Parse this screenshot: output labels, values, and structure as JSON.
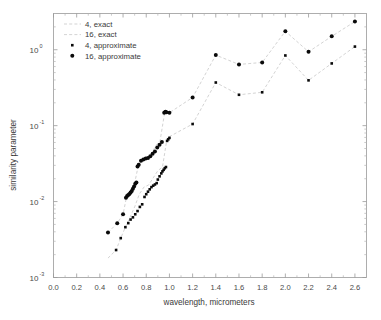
{
  "chart_data": {
    "type": "scatter",
    "title": "",
    "xlabel": "wavelength, micrometers",
    "ylabel": "similarity parameter",
    "xlim": [
      0.0,
      2.7
    ],
    "ylim": [
      0.001,
      3.0
    ],
    "yscale": "log",
    "xscale": "linear",
    "grid": false,
    "legend_position": "upper-left",
    "xticks": [
      "0.0",
      "0.2",
      "0.4",
      "0.6",
      "0.8",
      "1.0",
      "1.2",
      "1.4",
      "1.6",
      "1.8",
      "2.0",
      "2.2",
      "2.4",
      "2.6"
    ],
    "xtick_values": [
      0.0,
      0.2,
      0.4,
      0.6,
      0.8,
      1.0,
      1.2,
      1.4,
      1.6,
      1.8,
      2.0,
      2.2,
      2.4,
      2.6
    ],
    "yticks": [
      "10^0",
      "10^-1",
      "10^-2",
      "10^-3"
    ],
    "ytick_values": [
      1,
      0.1,
      0.01,
      0.001
    ],
    "ytick_base": "10",
    "ytick_exponents": [
      "0",
      "-1",
      "-2",
      "-3"
    ],
    "series": [
      {
        "name": "4, exact",
        "marker": "none",
        "line": "dashed",
        "color": "#c8c8c8",
        "x": [
          0.47,
          0.54,
          0.58,
          0.62,
          0.66,
          0.7,
          0.74,
          0.78,
          0.82,
          0.86,
          0.9,
          0.94,
          0.98,
          1.2,
          1.4,
          1.6,
          1.8,
          2.0,
          2.2,
          2.4,
          2.6
        ],
        "y": [
          0.0018,
          0.0023,
          0.0033,
          0.0046,
          0.0062,
          0.0085,
          0.0125,
          0.0155,
          0.0165,
          0.0205,
          0.0255,
          0.0285,
          0.069,
          0.105,
          0.37,
          0.255,
          0.275,
          0.84,
          0.395,
          0.66,
          1.1
        ]
      },
      {
        "name": "16, exact",
        "marker": "none",
        "line": "dashed",
        "color": "#c8c8c8",
        "x": [
          0.47,
          0.55,
          0.6,
          0.63,
          0.66,
          0.7,
          0.73,
          0.76,
          0.8,
          0.84,
          0.88,
          0.92,
          0.96,
          1.0,
          1.2,
          1.4,
          1.6,
          1.8,
          2.0,
          2.2,
          2.4,
          2.6
        ],
        "y": [
          0.0039,
          0.0052,
          0.0068,
          0.0115,
          0.0125,
          0.0175,
          0.029,
          0.036,
          0.037,
          0.041,
          0.054,
          0.064,
          0.152,
          0.148,
          0.235,
          0.85,
          0.64,
          0.68,
          1.75,
          0.94,
          1.5,
          2.35
        ]
      },
      {
        "name": "4, approximate",
        "marker": "square",
        "marker_size": 2.6,
        "line": "none",
        "color": "#0a0a0a",
        "x": [
          0.54,
          0.58,
          0.62,
          0.645,
          0.665,
          0.685,
          0.705,
          0.725,
          0.745,
          0.765,
          0.785,
          0.8,
          0.815,
          0.83,
          0.845,
          0.86,
          0.875,
          0.89,
          0.9,
          0.915,
          0.93,
          0.94,
          0.95,
          0.96,
          0.97,
          0.98,
          0.99,
          1.0,
          1.2,
          1.4,
          1.6,
          1.8,
          2.0,
          2.2,
          2.4,
          2.6
        ],
        "y": [
          0.0023,
          0.0033,
          0.0046,
          0.0052,
          0.0058,
          0.0062,
          0.0068,
          0.0075,
          0.0085,
          0.0092,
          0.0115,
          0.0125,
          0.0135,
          0.0145,
          0.0155,
          0.0162,
          0.0168,
          0.0175,
          0.0195,
          0.0215,
          0.0235,
          0.025,
          0.0262,
          0.0275,
          0.0285,
          0.063,
          0.066,
          0.069,
          0.105,
          0.37,
          0.255,
          0.275,
          0.84,
          0.395,
          0.66,
          1.1
        ]
      },
      {
        "name": "16, approximate",
        "marker": "circle",
        "marker_size": 4.0,
        "line": "none",
        "color": "#0a0a0a",
        "x": [
          0.47,
          0.55,
          0.6,
          0.625,
          0.635,
          0.645,
          0.655,
          0.665,
          0.675,
          0.685,
          0.695,
          0.705,
          0.715,
          0.725,
          0.735,
          0.755,
          0.775,
          0.795,
          0.815,
          0.835,
          0.855,
          0.875,
          0.895,
          0.915,
          0.935,
          0.955,
          0.965,
          0.975,
          1.0,
          1.2,
          1.4,
          1.6,
          1.8,
          2.0,
          2.2,
          2.4,
          2.6
        ],
        "y": [
          0.0039,
          0.0052,
          0.0068,
          0.0112,
          0.0118,
          0.0122,
          0.0126,
          0.0132,
          0.0138,
          0.0148,
          0.0158,
          0.0172,
          0.0178,
          0.029,
          0.0305,
          0.0345,
          0.0358,
          0.0368,
          0.0375,
          0.0395,
          0.0425,
          0.0455,
          0.0515,
          0.056,
          0.061,
          0.148,
          0.152,
          0.15,
          0.148,
          0.235,
          0.85,
          0.64,
          0.68,
          1.75,
          0.94,
          1.5,
          2.35
        ]
      }
    ]
  },
  "legend": {
    "items": [
      {
        "label": "4, exact",
        "type": "line"
      },
      {
        "label": "16, exact",
        "type": "line"
      },
      {
        "label": "4, approximate",
        "type": "square"
      },
      {
        "label": "16, approximate",
        "type": "circle"
      }
    ]
  }
}
